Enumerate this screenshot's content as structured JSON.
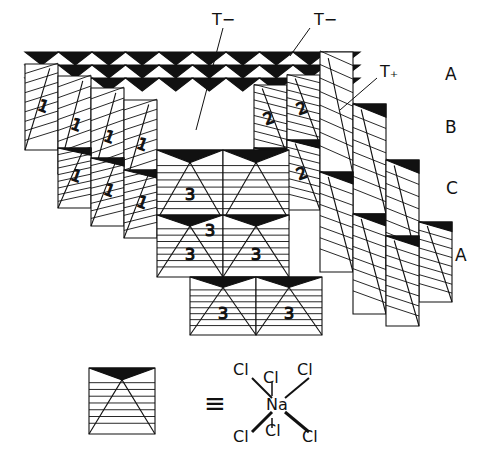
{
  "figure": {
    "layer_labels": [
      {
        "text": "A",
        "x": 445,
        "y": 64
      },
      {
        "text": "B",
        "x": 445,
        "y": 117
      },
      {
        "text": "C",
        "x": 446,
        "y": 178
      },
      {
        "text": "A",
        "x": 455,
        "y": 245
      }
    ],
    "tetrahedral_labels": [
      {
        "text": "T−",
        "x": 186,
        "y": 10
      },
      {
        "text": "T−",
        "x": 314,
        "y": 10
      },
      {
        "text": "T₊",
        "x": 380,
        "y": 62
      }
    ],
    "octahedron_numbers": [
      "1",
      "2",
      "3"
    ],
    "legend": {
      "equals": "≡",
      "central_atom": "Na",
      "ligand": "Cl",
      "ligand_count": 6
    },
    "colors": {
      "ink": "#111111",
      "background": "#ffffff"
    }
  }
}
